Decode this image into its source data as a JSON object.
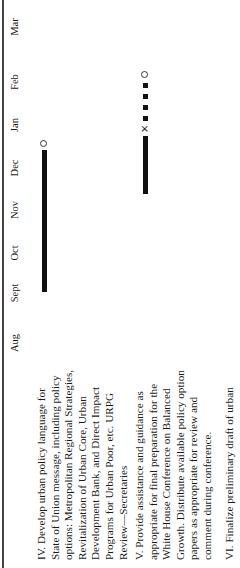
{
  "timeline": {
    "months": [
      "Aug",
      "Sept",
      "Oct",
      "Nov",
      "Dec",
      "Jan",
      "Feb",
      "Mar"
    ]
  },
  "items": [
    {
      "number": "IV.",
      "lines": [
        "IV.  Develop urban policy language for",
        "State of Union message, including policy",
        "options: Metropolitan Regional Strategies,",
        "Revitalization of Urban Core, Urban",
        "Development Bank, and Direct Impact",
        "Programs for Urban Poor, etc. URPG",
        "Review—Secretaries"
      ],
      "schedule": {
        "bar_start": "Sept",
        "bar_end": "Dec",
        "milestone": "circle (Dec)"
      }
    },
    {
      "number": "V.",
      "lines": [
        "V.  Provide assistance and guidance as",
        "appropriate for final preparation for the",
        "White House Conference on Balanced",
        "Growth. Distribute available policy option",
        "papers as appropriate for review and",
        "comment during conference."
      ],
      "schedule": {
        "bar_start": "Nov",
        "bar_end": "Jan",
        "x_mark": "Jan",
        "dotted_to": "Feb",
        "milestone": "circle (Feb)"
      }
    },
    {
      "number": "VI.",
      "lines": [
        "VI.  Finalize preliminary draft of urban"
      ]
    }
  ]
}
